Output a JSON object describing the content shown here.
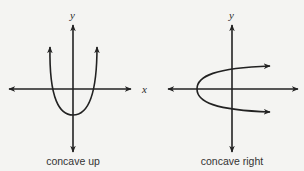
{
  "colors": {
    "background": "#f4f4f2",
    "ink": "#222222",
    "caption": "#333333"
  },
  "panels": [
    {
      "id": "concave-up",
      "caption": "concave up",
      "x_axis_label": "x",
      "y_axis_label": "y",
      "curve": "upward-opening parabola, vertex below x-axis, both arms with arrowheads pointing up"
    },
    {
      "id": "concave-right",
      "caption": "concave right",
      "x_axis_label": "",
      "y_axis_label": "y",
      "curve": "rightward-opening parabola, vertex left of y-axis on x-axis, both arms with arrowheads pointing right"
    }
  ],
  "labels": {
    "left_y": "y",
    "left_x": "x",
    "right_y": "y",
    "left_caption": "concave up",
    "right_caption": "concave right"
  }
}
